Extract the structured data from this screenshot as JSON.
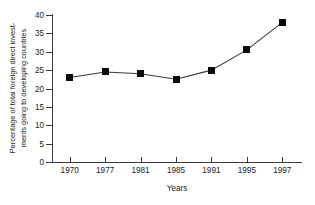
{
  "chart_data": {
    "type": "line",
    "title": "",
    "xlabel": "Years",
    "ylabel": "Percentage of total foreign direct invest-ments going to developing countries",
    "ylabel_line1": "Percentage of total foreign direct invest-",
    "ylabel_line2": "ments going to developing countries",
    "categories": [
      "1970",
      "1977",
      "1981",
      "1985",
      "1991",
      "1995",
      "1997"
    ],
    "values": [
      23,
      24.5,
      24,
      22.5,
      25,
      30.5,
      38
    ],
    "x_tick_labels": [
      "1970",
      "1977",
      "1981",
      "1985",
      "1991",
      "1995",
      "1997"
    ],
    "y_tick_labels": [
      "0",
      "5",
      "10",
      "15",
      "20",
      "25",
      "30",
      "35",
      "40"
    ],
    "y_tick_values": [
      0,
      5,
      10,
      15,
      20,
      25,
      30,
      35,
      40
    ],
    "ylim": [
      0,
      40
    ],
    "grid": false,
    "legend": false,
    "marker": "square",
    "marker_color": "#0b0b0b",
    "line_color": "#3a3a3a"
  }
}
